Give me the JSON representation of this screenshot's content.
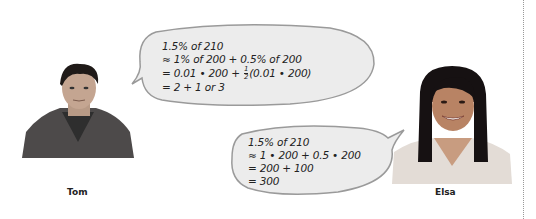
{
  "people": {
    "left": {
      "name": "Tom"
    },
    "right": {
      "name": "Elsa"
    }
  },
  "bubbles": {
    "tom": {
      "lines": [
        "1.5% of 210",
        "≈ 1% of 200 + 0.5% of 200",
        "= 0.01 • 200 + ",
        "(0.01 • 200)",
        "= 2 + 1 or 3"
      ],
      "fraction": {
        "num": "1",
        "den": "2"
      }
    },
    "elsa": {
      "lines": [
        "1.5% of 210",
        "≈ 1 • 200 + 0.5 • 200",
        "= 200 + 100",
        "= 300"
      ]
    }
  },
  "colors": {
    "bubble_fill": "#ececec",
    "bubble_stroke": "#9a9a9a",
    "divider": "#999999"
  }
}
